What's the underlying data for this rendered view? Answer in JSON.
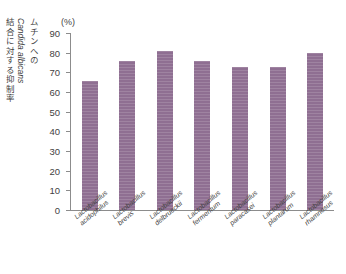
{
  "chart_data": {
    "type": "bar",
    "title": "",
    "subtitle": "",
    "unit_label": "(%)",
    "ylabel": "ムチンへの Candida albicans 結合に対する抑制率",
    "ylabel_parts": {
      "segment1": "ムチンへの",
      "segment2": "Candida albicans",
      "segment3": "結合に対する抑制率"
    },
    "xlabel": "",
    "categories": [
      "Lactobacillus acidophilus",
      "Lactobacillus brevis",
      "Lactobacillus delbrueckii",
      "Lactobacillus fermentum",
      "Lactobacillus paracasei",
      "Lactobacillus plantarum",
      "Lactobacillus rhamnosus"
    ],
    "category_lines": [
      [
        "Lactobacillus",
        "acidophilus"
      ],
      [
        "Lactobacillus",
        "brevis"
      ],
      [
        "Lactobacillus",
        "delbrueckii"
      ],
      [
        "Lactobacillus",
        "fermentum"
      ],
      [
        "Lactobacillus",
        "paracasei"
      ],
      [
        "Lactobacillus",
        "plantarum"
      ],
      [
        "Lactobacillus",
        "rhamnosus"
      ]
    ],
    "values": [
      65.5,
      76.0,
      81.0,
      76.0,
      72.5,
      72.5,
      80.0
    ],
    "ylim": [
      0,
      90
    ],
    "yticks": [
      0,
      10,
      20,
      30,
      40,
      50,
      60,
      70,
      80,
      90
    ],
    "ytick_labels": [
      "0",
      "10",
      "20",
      "30",
      "40",
      "50",
      "60",
      "70",
      "80",
      "90"
    ],
    "grid": false,
    "legend": false,
    "legend_position": "none",
    "bar_color": "#8f6f92",
    "axis_color": "#8c8c8c",
    "text_color": "#3f3f3f"
  }
}
